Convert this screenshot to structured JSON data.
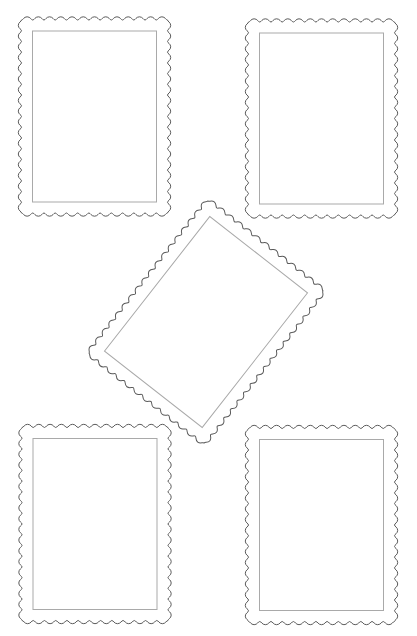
{
  "page": {
    "background": "#ffffff",
    "width": 417,
    "height": 636
  },
  "style": {
    "perforation_stroke": "#5a5a5a",
    "frame_stroke": "#a9a9a9"
  },
  "stamp_template": {
    "width": 146,
    "height": 193,
    "scallop_pitch": 11,
    "frame_inset": 11
  },
  "stamps": [
    {
      "id": "top-left",
      "cx": 94.5,
      "cy": 116.5,
      "rotation": 0
    },
    {
      "id": "top-right",
      "cx": 321.5,
      "cy": 118.5,
      "rotation": 0
    },
    {
      "id": "center-rotated",
      "cx": 206,
      "cy": 322,
      "rotation": 38
    },
    {
      "id": "bottom-left",
      "cx": 95,
      "cy": 524,
      "rotation": 0
    },
    {
      "id": "bottom-right",
      "cx": 321.5,
      "cy": 525,
      "rotation": 0
    }
  ]
}
